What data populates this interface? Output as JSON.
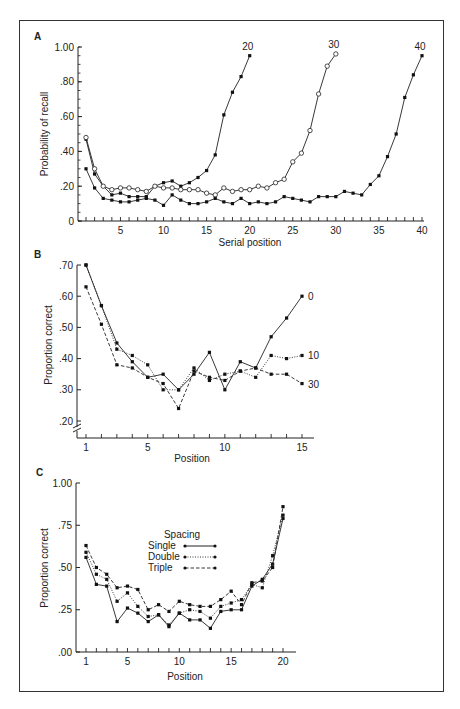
{
  "chart_data": [
    {
      "panel": "A",
      "type": "line",
      "title": "",
      "xlabel": "Serial position",
      "ylabel": "Probability of recall",
      "ylim": [
        0,
        1.0
      ],
      "xlim": [
        1,
        40
      ],
      "yticks": [
        "0",
        ".20",
        ".40",
        ".60",
        ".80",
        "1.00"
      ],
      "xticks": [
        "5",
        "10",
        "15",
        "20",
        "25",
        "30",
        "35",
        "40"
      ],
      "grid": false,
      "series": [
        {
          "name": "20",
          "marker": "filled",
          "x": [
            1,
            2,
            3,
            4,
            5,
            6,
            7,
            8,
            9,
            10,
            11,
            12,
            13,
            14,
            15,
            16,
            17,
            18,
            19,
            20
          ],
          "values": [
            0.47,
            0.27,
            0.2,
            0.15,
            0.16,
            0.14,
            0.14,
            0.14,
            0.2,
            0.22,
            0.23,
            0.2,
            0.22,
            0.25,
            0.29,
            0.38,
            0.61,
            0.74,
            0.83,
            0.95
          ]
        },
        {
          "name": "30",
          "marker": "open",
          "x": [
            1,
            2,
            3,
            4,
            5,
            6,
            7,
            8,
            9,
            10,
            11,
            12,
            13,
            14,
            15,
            16,
            17,
            18,
            19,
            20,
            21,
            22,
            23,
            24,
            25,
            26,
            27,
            28,
            29,
            30
          ],
          "values": [
            0.48,
            0.3,
            0.2,
            0.18,
            0.19,
            0.19,
            0.18,
            0.17,
            0.2,
            0.19,
            0.19,
            0.18,
            0.18,
            0.18,
            0.16,
            0.15,
            0.19,
            0.17,
            0.18,
            0.18,
            0.2,
            0.19,
            0.22,
            0.24,
            0.34,
            0.39,
            0.52,
            0.73,
            0.89,
            0.96
          ]
        },
        {
          "name": "40",
          "marker": "filled",
          "x": [
            1,
            2,
            3,
            4,
            5,
            6,
            7,
            8,
            9,
            10,
            11,
            12,
            13,
            14,
            15,
            16,
            17,
            18,
            19,
            20,
            21,
            22,
            23,
            24,
            25,
            26,
            27,
            28,
            29,
            30,
            31,
            32,
            33,
            34,
            35,
            36,
            37,
            38,
            39,
            40
          ],
          "values": [
            0.3,
            0.19,
            0.13,
            0.12,
            0.11,
            0.11,
            0.12,
            0.13,
            0.12,
            0.09,
            0.15,
            0.12,
            0.1,
            0.1,
            0.11,
            0.13,
            0.11,
            0.1,
            0.13,
            0.1,
            0.11,
            0.1,
            0.11,
            0.14,
            0.13,
            0.12,
            0.11,
            0.14,
            0.14,
            0.14,
            0.17,
            0.16,
            0.15,
            0.21,
            0.26,
            0.37,
            0.5,
            0.71,
            0.84,
            0.95
          ]
        }
      ]
    },
    {
      "panel": "B",
      "type": "line",
      "title": "",
      "xlabel": "Position",
      "ylabel": "Proportion correct",
      "ylim": [
        0.2,
        0.7
      ],
      "xlim": [
        1,
        15
      ],
      "yticks": [
        ".20",
        ".30",
        ".40",
        ".50",
        ".60",
        ".70"
      ],
      "xticks": [
        "1",
        "5",
        "10",
        "15"
      ],
      "axis_break": true,
      "grid": false,
      "series": [
        {
          "name": "0",
          "line": "solid",
          "x": [
            1,
            2,
            3,
            4,
            5,
            6,
            7,
            8,
            9,
            10,
            11,
            12,
            13,
            14,
            15
          ],
          "values": [
            0.7,
            0.57,
            0.45,
            0.39,
            0.34,
            0.35,
            0.3,
            0.35,
            0.42,
            0.3,
            0.39,
            0.37,
            0.47,
            0.53,
            0.6
          ]
        },
        {
          "name": "10",
          "line": "dotted",
          "x": [
            1,
            2,
            3,
            4,
            5,
            6,
            7,
            8,
            9,
            10,
            11,
            12,
            13,
            14,
            15
          ],
          "values": [
            0.7,
            0.57,
            0.43,
            0.41,
            0.38,
            0.3,
            0.3,
            0.37,
            0.33,
            0.35,
            0.36,
            0.34,
            0.41,
            0.4,
            0.41
          ]
        },
        {
          "name": "30",
          "line": "dashed",
          "x": [
            1,
            2,
            3,
            4,
            5,
            6,
            7,
            8,
            9,
            10,
            11,
            12,
            13,
            14,
            15
          ],
          "values": [
            0.63,
            0.51,
            0.38,
            0.37,
            0.34,
            0.32,
            0.24,
            0.36,
            0.34,
            0.33,
            0.36,
            0.37,
            0.35,
            0.35,
            0.32
          ]
        }
      ]
    },
    {
      "panel": "C",
      "type": "line",
      "title": "",
      "xlabel": "Position",
      "ylabel": "Proportion correct",
      "ylim": [
        0.0,
        1.0
      ],
      "xlim": [
        1,
        20
      ],
      "yticks": [
        ".00",
        ".25",
        ".50",
        ".75",
        "1.00"
      ],
      "xticks": [
        "1",
        "5",
        "10",
        "15",
        "20"
      ],
      "grid": false,
      "legend": {
        "title": "Spacing",
        "position": "upper-center",
        "entries": [
          "Single",
          "Double",
          "Triple"
        ]
      },
      "series": [
        {
          "name": "Single",
          "line": "solid",
          "x": [
            1,
            2,
            3,
            4,
            5,
            6,
            7,
            8,
            9,
            10,
            11,
            12,
            13,
            14,
            15,
            16,
            17,
            18,
            19,
            20
          ],
          "values": [
            0.56,
            0.4,
            0.39,
            0.18,
            0.26,
            0.23,
            0.18,
            0.22,
            0.15,
            0.23,
            0.19,
            0.19,
            0.14,
            0.24,
            0.25,
            0.25,
            0.39,
            0.43,
            0.52,
            0.79
          ]
        },
        {
          "name": "Double",
          "line": "dotted",
          "x": [
            1,
            2,
            3,
            4,
            5,
            6,
            7,
            8,
            9,
            10,
            11,
            12,
            13,
            14,
            15,
            16,
            17,
            18,
            19,
            20
          ],
          "values": [
            0.59,
            0.46,
            0.43,
            0.3,
            0.35,
            0.27,
            0.21,
            0.22,
            0.16,
            0.23,
            0.25,
            0.24,
            0.2,
            0.27,
            0.29,
            0.31,
            0.4,
            0.38,
            0.57,
            0.81
          ]
        },
        {
          "name": "Triple",
          "line": "dashed",
          "x": [
            1,
            2,
            3,
            4,
            5,
            6,
            7,
            8,
            9,
            10,
            11,
            12,
            13,
            14,
            15,
            16,
            17,
            18,
            19,
            20
          ],
          "values": [
            0.63,
            0.5,
            0.46,
            0.38,
            0.39,
            0.37,
            0.25,
            0.28,
            0.24,
            0.3,
            0.28,
            0.27,
            0.27,
            0.31,
            0.36,
            0.28,
            0.41,
            0.42,
            0.5,
            0.86
          ]
        }
      ]
    }
  ],
  "labels": {
    "panel_a": "A",
    "panel_b": "B",
    "panel_c": "C",
    "a_xlabel": "Serial position",
    "a_ylabel": "Probability of recall",
    "b_xlabel": "Position",
    "b_ylabel": "Proportion correct",
    "c_xlabel": "Position",
    "c_ylabel": "Proportion correct",
    "legend_title": "Spacing",
    "legend_single": "Single",
    "legend_double": "Double",
    "legend_triple": "Triple"
  }
}
